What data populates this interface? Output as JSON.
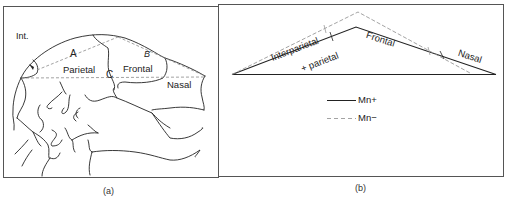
{
  "figure": {
    "panel_a": {
      "caption": "(a)",
      "labels": {
        "int": "Int.",
        "a": "A",
        "b": "B",
        "c": "C",
        "parietal": "Parietal",
        "frontal": "Frontal",
        "nasal": "Nasal"
      }
    },
    "panel_b": {
      "caption": "(b)",
      "labels": {
        "interparietal": "Interparietal",
        "plus_parietal": "+ parietal",
        "frontal": "Frontal",
        "nasal": "Nasal"
      },
      "legend": [
        {
          "style": "solid",
          "label": "Mn+"
        },
        {
          "style": "dashed",
          "label": "Mn−"
        }
      ]
    },
    "colors": {
      "line": "#222222",
      "dashed": "#9a9a9a",
      "frame": "#555555"
    }
  }
}
